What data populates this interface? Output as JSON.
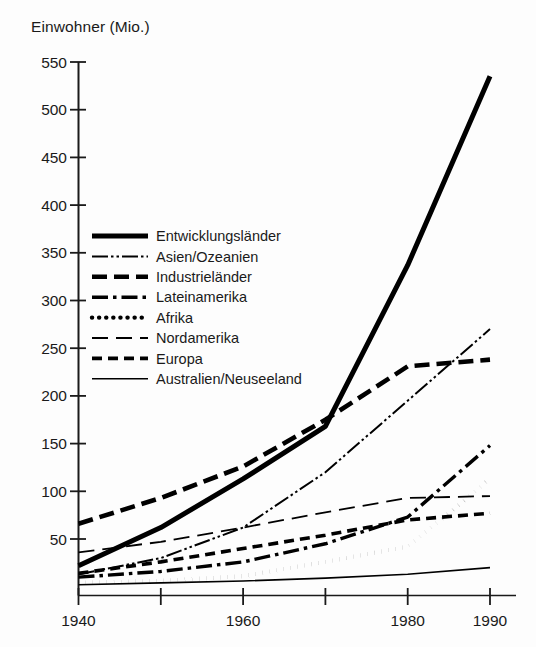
{
  "chart_data": {
    "type": "line",
    "title": "",
    "ylabel": "Einwohner (Mio.)",
    "xlabel": "",
    "x": [
      1940,
      1950,
      1960,
      1970,
      1980,
      1990
    ],
    "xlim": [
      1940,
      1990
    ],
    "ylim": [
      0,
      560
    ],
    "ytick_labels": [
      "50",
      "100",
      "150",
      "200",
      "250",
      "300",
      "350",
      "400",
      "450",
      "500",
      "550"
    ],
    "ytick_values": [
      50,
      100,
      150,
      200,
      250,
      300,
      350,
      400,
      450,
      500,
      550
    ],
    "xtick_values": [
      1940,
      1950,
      1960,
      1970,
      1980,
      1990
    ],
    "xtick_labels": [
      "1940",
      "",
      "1960",
      "",
      "1980",
      "1990"
    ],
    "grid": false,
    "legend_position": "inside-upper-left",
    "series": [
      {
        "name": "Entwicklungsländer",
        "style": "solid-thick",
        "values": [
          22,
          62,
          113,
          168,
          337,
          535
        ]
      },
      {
        "name": "Asien/Ozeanien",
        "style": "dash-dot-dot",
        "values": [
          13,
          30,
          62,
          120,
          195,
          270
        ]
      },
      {
        "name": "Industrieländer",
        "style": "dashed-thick",
        "values": [
          66,
          93,
          126,
          175,
          231,
          238
        ]
      },
      {
        "name": "Lateinamerika",
        "style": "dash-dot",
        "values": [
          10,
          16,
          26,
          45,
          73,
          148
        ]
      },
      {
        "name": "Afrika",
        "style": "dotted",
        "values": [
          4,
          6,
          11,
          26,
          42,
          113
        ]
      },
      {
        "name": "Nordamerika",
        "style": "long-dash",
        "values": [
          36,
          47,
          62,
          78,
          93,
          95
        ]
      },
      {
        "name": "Europa",
        "style": "dashed-short",
        "values": [
          14,
          26,
          40,
          54,
          70,
          77
        ]
      },
      {
        "name": "Australien/Neuseeland",
        "style": "solid-thin",
        "values": [
          2,
          4,
          6,
          9,
          13,
          20
        ]
      }
    ]
  },
  "legend": {
    "items": [
      {
        "label": "Entwicklungsländer"
      },
      {
        "label": "Asien/Ozeanien"
      },
      {
        "label": "Industrieländer"
      },
      {
        "label": "Lateinamerika"
      },
      {
        "label": "Afrika"
      },
      {
        "label": "Nordamerika"
      },
      {
        "label": "Europa"
      },
      {
        "label": "Australien/Neuseeland"
      }
    ]
  }
}
